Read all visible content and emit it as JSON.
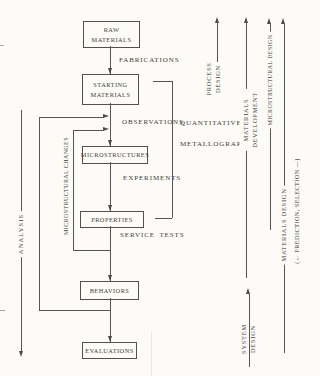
{
  "figure": {
    "boxes": {
      "raw_materials": "RAW\nMATERIALS",
      "starting_materials": "STARTING\nMATERIALS",
      "microstructures": "MICROSTRUCTURES",
      "properties": "PROPERTIES",
      "behaviors": "BEHAVIORS",
      "evaluations": "EVALUATIONS"
    },
    "edge_labels": {
      "fabrications": "FABRICATIONS",
      "observations": "OBSERVATIONS",
      "experiments": "EXPERIMENTS",
      "service_tests": "SERVICE TESTS"
    },
    "side_labels": {
      "analysis": "ANALYSIS",
      "microstructural_changes": "MICROSTRUCTURAL CHANGES",
      "quantitative_metallography_line1": "QUANTITATIVE",
      "quantitative_metallography_line2": "METALLOGRAPHY",
      "process_design": "PROCESS\nDESIGN",
      "materials_development": "MATERIALS\nDEVELOPMENT",
      "microstructural_design": "MICROSTRUCTURAL DESIGN",
      "materials_design": "MATERIALS DESIGN",
      "prediction_selection": "(← PREDICTION, SELECTION —)",
      "system_design": "SYSTEM\nDESIGN"
    },
    "colors": {
      "paper": "#fcfbf7",
      "ink": "#423e38",
      "line": "#5a554e"
    }
  }
}
